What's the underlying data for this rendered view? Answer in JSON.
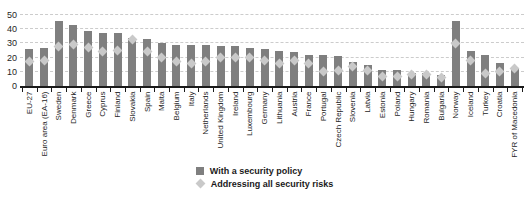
{
  "chart_data": {
    "type": "bar",
    "title": "",
    "xlabel": "",
    "ylabel": "",
    "ylim": [
      0,
      50
    ],
    "yticks": [
      0,
      10,
      20,
      30,
      40,
      50
    ],
    "grid": "horizontal-dashed",
    "legend_position": "bottom-center",
    "categories": [
      "EU-27",
      "Euro area (EA-16)",
      "Sweden",
      "Denmark",
      "Greece",
      "Cyprus",
      "Finland",
      "Slovakia",
      "Spain",
      "Malta",
      "Belgium",
      "Italy",
      "Netherlands",
      "United Kingdom",
      "Ireland",
      "Luxembourg",
      "Germany",
      "Lithuania",
      "Austria",
      "France",
      "Portugal",
      "Czech Republic",
      "Slovenia",
      "Latvia",
      "Estonia",
      "Poland",
      "Hungary",
      "Romania",
      "Bulgaria",
      "Norway",
      "Iceland",
      "Turkey",
      "Croatia",
      "FYR of Macedonia"
    ],
    "series": [
      {
        "name": "With a security policy",
        "type": "bar",
        "color": "#7f7f7f",
        "values": [
          26,
          27,
          46,
          43,
          39,
          37,
          37,
          34,
          33,
          30,
          29,
          29,
          29,
          28,
          28,
          27,
          26,
          25,
          24,
          22,
          22,
          21,
          17,
          15,
          11,
          11,
          9,
          9,
          8,
          46,
          25,
          22,
          16,
          13
        ]
      },
      {
        "name": "Addressing all security risks",
        "type": "diamond-marker",
        "color": "#c9c9c9",
        "values": [
          17,
          18,
          28,
          29,
          27,
          24,
          25,
          33,
          24,
          20,
          17,
          16,
          17,
          20,
          20,
          20,
          18,
          16,
          18,
          16,
          10,
          11,
          14,
          11,
          7,
          7,
          8,
          8,
          6,
          30,
          18,
          9,
          10,
          12
        ]
      }
    ],
    "axis_color": "#1a1a1a",
    "gridline_color": "#cccccc",
    "tick_label_color": "#262626"
  }
}
